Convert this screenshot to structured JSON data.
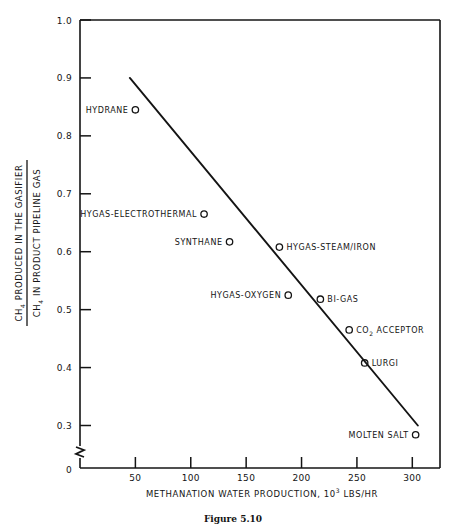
{
  "chart_data": {
    "type": "scatter",
    "title": "",
    "xlabel_parts": {
      "main": "METHANATION WATER PRODUCTION, 10",
      "exponent": "3",
      "tail": " LBS/HR"
    },
    "xlabel": "METHANATION WATER PRODUCTION, 10^3 LBS/HR",
    "ylabel_numerator_parts": {
      "lead": "CH",
      "sub": "4",
      "tail": " PRODUCED IN THE GASIFIER"
    },
    "ylabel_denominator_parts": {
      "lead": "CH",
      "sub": "4",
      "tail": " IN PRODUCT PIPELINE GAS"
    },
    "ylabel": "CH4 PRODUCED IN THE GASIFIER / CH4 IN PRODUCT PIPELINE GAS",
    "xlim": [
      0,
      325
    ],
    "ylim": [
      0.26,
      1.0
    ],
    "xticks": [
      50,
      100,
      150,
      200,
      250,
      300
    ],
    "xtick_labels": [
      "50",
      "100",
      "150",
      "200",
      "250",
      "300"
    ],
    "yticks": [
      0.3,
      0.4,
      0.5,
      0.6,
      0.7,
      0.8,
      0.9,
      1.0
    ],
    "ytick_labels": [
      "0.3",
      "0.4",
      "0.5",
      "0.6",
      "0.7",
      "0.8",
      "0.9",
      "1.0"
    ],
    "origin_label": "0",
    "axis_break_marker": "zigzag-break",
    "grid": false,
    "legend": "none",
    "marker_style": "open-circle",
    "points": [
      {
        "label": "HYDRANE",
        "x": 50,
        "y": 0.845,
        "label_side": "left"
      },
      {
        "label": "HYGAS-ELECTROTHERMAL",
        "x": 112,
        "y": 0.665,
        "label_side": "left"
      },
      {
        "label": "SYNTHANE",
        "x": 135,
        "y": 0.617,
        "label_side": "left"
      },
      {
        "label": "HYGAS-STEAM/IRON",
        "x": 180,
        "y": 0.608,
        "label_side": "right"
      },
      {
        "label": "HYGAS-OXYGEN",
        "x": 188,
        "y": 0.525,
        "label_side": "left"
      },
      {
        "label": "BI-GAS",
        "x": 217,
        "y": 0.518,
        "label_side": "right"
      },
      {
        "label": "CO2 ACCEPTOR",
        "x": 243,
        "y": 0.465,
        "label_side": "right",
        "label_has_subscript": true,
        "label_lead": "CO",
        "label_sub": "2",
        "label_tail": " ACCEPTOR"
      },
      {
        "label": "LURGI",
        "x": 257,
        "y": 0.408,
        "label_side": "right"
      },
      {
        "label": "MOLTEN SALT",
        "x": 303,
        "y": 0.284,
        "label_side": "left"
      }
    ],
    "trend_line": {
      "x1": 45,
      "y1": 0.9,
      "x2": 305,
      "y2": 0.3
    },
    "colors": {
      "ink": "#141414",
      "background": "#ffffff"
    }
  },
  "caption": {
    "text": "Figure 5.10"
  }
}
